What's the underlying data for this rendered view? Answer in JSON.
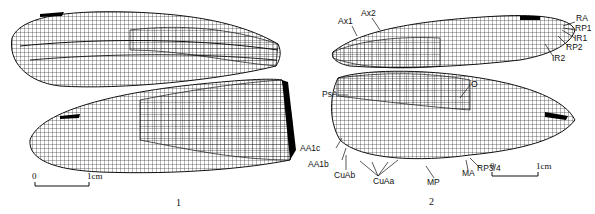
{
  "figure": {
    "panels": [
      {
        "number": "1",
        "description": "Fore wing and hind wing venation (left specimen)",
        "scale_bar": {
          "start_label": "0",
          "end_label": "1cm"
        }
      },
      {
        "number": "2",
        "description": "Fore wing and hind wing venation with vein labels (right specimen)",
        "scale_bar": {
          "start_label": "0",
          "end_label": "1cm"
        },
        "vein_labels": {
          "ax1": "Ax1",
          "ax2": "Ax2",
          "ra": "RA",
          "rp1": "RP1",
          "ir1": "IR1",
          "rp2": "RP2",
          "ir2": "IR2",
          "psa": "PsA",
          "o": "O",
          "aa1c": "AA1c",
          "aa1b": "AA1b",
          "cuab": "CuAb",
          "cuaa": "CuAa",
          "mp": "MP",
          "ma": "MA",
          "rp34": "RP3/4"
        }
      }
    ]
  },
  "colors": {
    "line": "#111111",
    "background": "#ffffff",
    "pterostigma": "#000000"
  }
}
